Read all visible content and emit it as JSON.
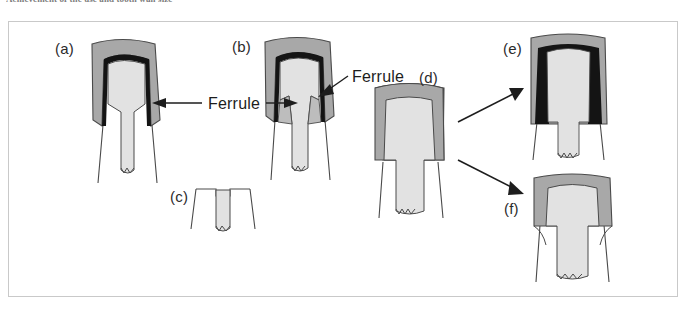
{
  "figure": {
    "caption_fragment": "Achievement of the use and tooth wall size",
    "frame": {
      "x": 8,
      "y": 21,
      "width": 670,
      "height": 276,
      "border_color": "#c9c9c9",
      "background": "#ffffff"
    },
    "colors": {
      "crown_gray": "#a8a8a8",
      "core_light": "#e2e2e2",
      "dentin_white": "#ffffff",
      "outline": "#4a4a4a",
      "cement_black": "#111111",
      "text": "#1d1d1d"
    },
    "panels": [
      {
        "id": "a",
        "label": "(a)",
        "x": 55,
        "y": 40,
        "description": "crown with long tapered post and ferrule on tooth structure"
      },
      {
        "id": "b",
        "label": "(b)",
        "x": 232,
        "y": 38,
        "description": "crown with post, ferrule marked on both sides"
      },
      {
        "id": "c",
        "label": "(c)",
        "x": 170,
        "y": 188,
        "description": "root face with core only, no crown, no ferrule"
      },
      {
        "id": "d",
        "label": "(d)",
        "x": 419,
        "y": 69,
        "description": "crown over core with short remaining tooth structure"
      },
      {
        "id": "e",
        "label": "(e)",
        "x": 503,
        "y": 40,
        "description": "crown with thick dark cement layer seating on ferrule"
      },
      {
        "id": "f",
        "label": "(f)",
        "x": 504,
        "y": 200,
        "description": "crown seated without ferrule on core"
      }
    ],
    "annotations": [
      {
        "id": "ferrule-1",
        "text": "Ferrule",
        "x": 208,
        "y": 95,
        "arrows": [
          "left-into-panel-a",
          "right-into-panel-b"
        ]
      },
      {
        "id": "ferrule-2",
        "text": "Ferrule",
        "x": 352,
        "y": 68,
        "arrows": [
          "down-left-into-panel-b"
        ]
      }
    ],
    "flow_arrows": [
      {
        "from": "d",
        "to": "e",
        "direction": "up-right"
      },
      {
        "from": "d",
        "to": "f",
        "direction": "down-right"
      }
    ]
  }
}
